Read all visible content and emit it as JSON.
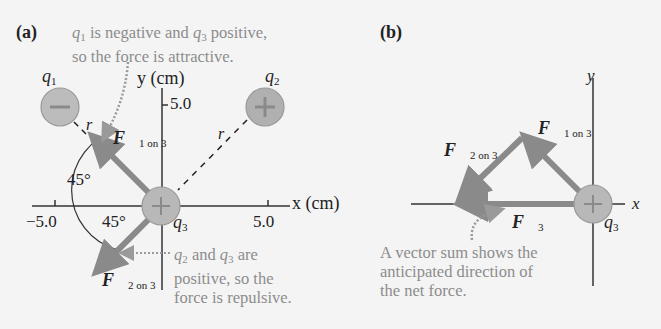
{
  "panel_a": {
    "label": "(a)",
    "note_top": [
      "is negative and",
      "positive,",
      "so the force is attractive."
    ],
    "q1": "q",
    "q1_sub": "1",
    "q2": "q",
    "q2_sub": "2",
    "q3": "q",
    "q3_sub": "3",
    "y_axis": "y (cm)",
    "x_axis": "x (cm)",
    "y_tick": "5.0",
    "x_tick_neg": "−5.0",
    "x_tick_pos": "5.0",
    "angle_top": "45°",
    "angle_bottom": "45°",
    "r_label": "r",
    "f1_sub": "1 on 3",
    "f2_sub": "2 on 3",
    "note_bottom": [
      "and",
      "are",
      "positive, so the",
      "force is repulsive."
    ]
  },
  "panel_b": {
    "label": "(b)",
    "y_axis": "y",
    "x_axis": "x",
    "f1_sub": "1 on 3",
    "f2_sub": "2 on 3",
    "f3_sub": "3",
    "q3_sub": "3",
    "note": [
      "A vector sum shows the",
      "anticipated direction of",
      "the net force."
    ]
  },
  "colors": {
    "arrow": "#8a8a8a",
    "charge_fill": "#b5b5b5",
    "text_gray": "#8c8c8c",
    "text_dark": "#222222"
  }
}
